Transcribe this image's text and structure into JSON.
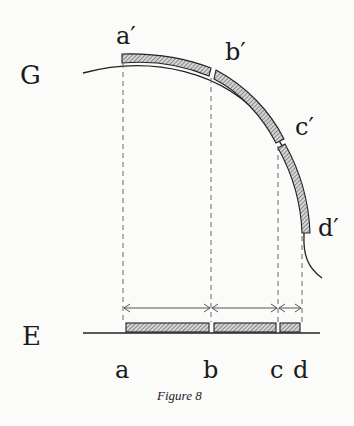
{
  "figure": {
    "caption": "Figure 8",
    "curve_label": "G",
    "line_label": "E",
    "curve_points": {
      "a_prime": "a′",
      "b_prime": "b′",
      "c_prime": "c′",
      "d_prime": "d′"
    },
    "line_points": {
      "a": "a",
      "b": "b",
      "c": "c",
      "d": "d"
    },
    "colors": {
      "ink": "#222222",
      "hatch_fill": "#9a9a9a",
      "background": "#fbfbfa",
      "dash": "#666666"
    }
  }
}
